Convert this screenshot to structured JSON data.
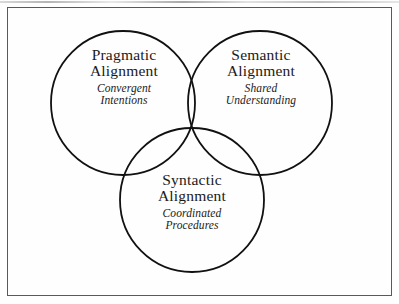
{
  "figure": {
    "type": "venn-diagram",
    "set_count": 3,
    "background_color": "#fefefe",
    "stroke_color": "#111111",
    "frame_color": "#555a5e",
    "sets": [
      {
        "id": "pragmatic",
        "title_line1": "Pragmatic",
        "title_line2": "Alignment",
        "subtitle_line1": "Convergent",
        "subtitle_line2": "Intentions",
        "position": "top-left"
      },
      {
        "id": "semantic",
        "title_line1": "Semantic",
        "title_line2": "Alignment",
        "subtitle_line1": "Shared",
        "subtitle_line2": "Understanding",
        "position": "top-right"
      },
      {
        "id": "syntactic",
        "title_line1": "Syntactic",
        "title_line2": "Alignment",
        "subtitle_line1": "Coordinated",
        "subtitle_line2": "Procedures",
        "position": "bottom-center"
      }
    ]
  }
}
